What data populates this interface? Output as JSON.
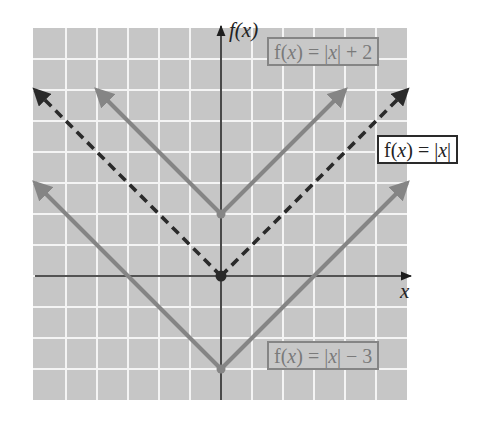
{
  "chart_data": {
    "type": "line",
    "title": "",
    "xlabel": "x",
    "ylabel": "f(x)",
    "xlim": [
      -6,
      6
    ],
    "ylim": [
      -4,
      8
    ],
    "grid": true,
    "legend": "inline labels",
    "series": [
      {
        "name": "f(x) = |x|",
        "style": "dashed",
        "color": "#2a2a2a",
        "points": [
          [
            -6,
            6
          ],
          [
            0,
            0
          ],
          [
            6,
            6
          ]
        ],
        "vertex": [
          0,
          0
        ]
      },
      {
        "name": "f(x) = |x| + 2",
        "style": "solid",
        "color": "#858585",
        "points": [
          [
            -4,
            6
          ],
          [
            0,
            2
          ],
          [
            4,
            6
          ]
        ],
        "vertex": [
          0,
          2
        ]
      },
      {
        "name": "f(x) = |x| − 3",
        "style": "solid",
        "color": "#858585",
        "points": [
          [
            -6,
            3
          ],
          [
            0,
            -3
          ],
          [
            6,
            3
          ]
        ],
        "vertex": [
          0,
          -3
        ]
      }
    ]
  },
  "labels": {
    "y_axis": "f(x)",
    "x_axis": "x",
    "plus2": {
      "pre": "f(",
      "var": "x",
      "mid": ") = |",
      "var2": "x",
      "post": "| + 2"
    },
    "base": {
      "pre": "f(",
      "var": "x",
      "mid": ") = |",
      "var2": "x",
      "post": "|"
    },
    "minus3": {
      "pre": "f(",
      "var": "x",
      "mid": ") = |",
      "var2": "x",
      "post": "| − 3"
    }
  },
  "colors": {
    "grid_bg": "#c6c6c6",
    "grid_line": "#f4f4f4",
    "axis": "#1e1e1e",
    "shifted": "#858585",
    "base": "#2a2a2a"
  }
}
